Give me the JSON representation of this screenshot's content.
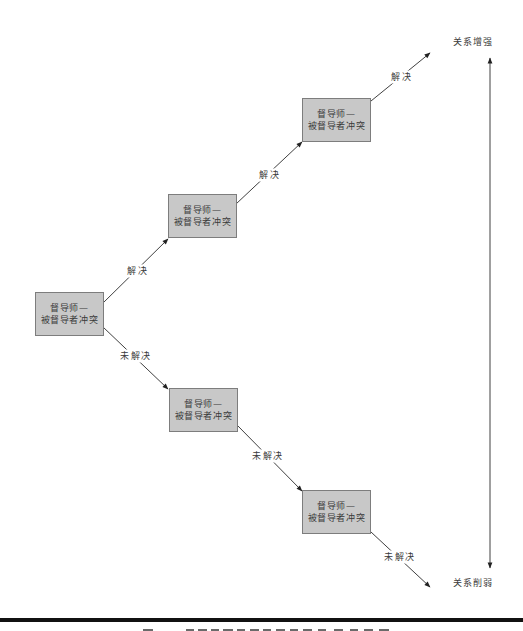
{
  "figure": {
    "nodes": [
      {
        "line1": "督导师—",
        "line2": "被督导者冲突"
      },
      {
        "line1": "督导师—",
        "line2": "被督导者冲突"
      },
      {
        "line1": "督导师—",
        "line2": "被督导者冲突"
      },
      {
        "line1": "督导师—",
        "line2": "被督导者冲突"
      },
      {
        "line1": "督导师—",
        "line2": "被督导者冲突"
      }
    ],
    "edges": [
      {
        "from": 0,
        "to": 1,
        "label": "解决"
      },
      {
        "from": 0,
        "to": 3,
        "label": "未解决"
      },
      {
        "from": 1,
        "to": 2,
        "label": "解决"
      },
      {
        "from": 3,
        "to": 4,
        "label": "未解决"
      },
      {
        "from": 2,
        "to": "outcome_top",
        "label": "解决"
      },
      {
        "from": 4,
        "to": "outcome_bottom",
        "label": "未解决"
      }
    ],
    "axis": {
      "top_label": "关系增强",
      "bottom_label": "关系削弱"
    }
  },
  "colors": {
    "node_fill": "#c8c8c8",
    "node_border": "#7d7d7d",
    "line": "#2a2a2a",
    "rule": "#111111"
  }
}
